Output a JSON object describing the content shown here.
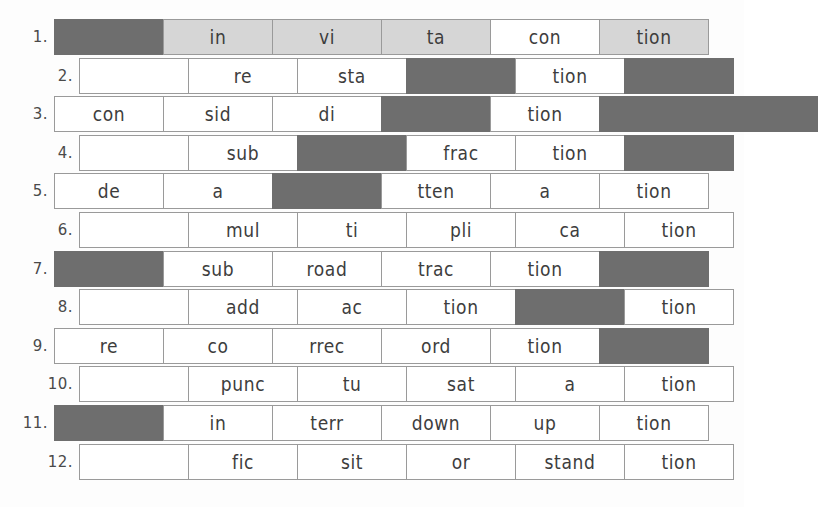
{
  "worksheet": {
    "title": "Syllable Grid Worksheet",
    "cell_width": 110,
    "row_height": 36,
    "colors": {
      "blocked": "#6e6e6e",
      "highlight": "#d6d6d6",
      "open": "#ffffff",
      "border": "#9a9a9a",
      "text": "#3d3d3d"
    },
    "rows": [
      {
        "number": "1.",
        "offset": 0,
        "highlight": true,
        "cells": [
          {
            "text": "",
            "state": "blocked"
          },
          {
            "text": "in",
            "state": "highlight"
          },
          {
            "text": "vi",
            "state": "highlight"
          },
          {
            "text": "ta",
            "state": "highlight"
          },
          {
            "text": "con",
            "state": "open"
          },
          {
            "text": "tion",
            "state": "highlight"
          }
        ]
      },
      {
        "number": "2.",
        "offset": 1,
        "highlight": false,
        "cells": [
          {
            "text": "",
            "state": "open"
          },
          {
            "text": "re",
            "state": "open"
          },
          {
            "text": "sta",
            "state": "open"
          },
          {
            "text": "",
            "state": "blocked"
          },
          {
            "text": "tion",
            "state": "open"
          },
          {
            "text": "",
            "state": "blocked"
          }
        ]
      },
      {
        "number": "3.",
        "offset": 0,
        "highlight": false,
        "cells": [
          {
            "text": "con",
            "state": "open"
          },
          {
            "text": "sid",
            "state": "open"
          },
          {
            "text": "di",
            "state": "open"
          },
          {
            "text": "",
            "state": "blocked"
          },
          {
            "text": "tion",
            "state": "open"
          },
          {
            "text": "",
            "state": "blocked"
          },
          {
            "text": "",
            "state": "blocked"
          }
        ]
      },
      {
        "number": "4.",
        "offset": 1,
        "highlight": false,
        "cells": [
          {
            "text": "",
            "state": "open"
          },
          {
            "text": "sub",
            "state": "open"
          },
          {
            "text": "",
            "state": "blocked"
          },
          {
            "text": "frac",
            "state": "open"
          },
          {
            "text": "tion",
            "state": "open"
          },
          {
            "text": "",
            "state": "blocked"
          }
        ]
      },
      {
        "number": "5.",
        "offset": 0,
        "highlight": false,
        "cells": [
          {
            "text": "de",
            "state": "open"
          },
          {
            "text": "a",
            "state": "open"
          },
          {
            "text": "",
            "state": "blocked"
          },
          {
            "text": "tten",
            "state": "open"
          },
          {
            "text": "a",
            "state": "open"
          },
          {
            "text": "tion",
            "state": "open"
          }
        ]
      },
      {
        "number": "6.",
        "offset": 1,
        "highlight": false,
        "cells": [
          {
            "text": "",
            "state": "open"
          },
          {
            "text": "mul",
            "state": "open"
          },
          {
            "text": "ti",
            "state": "open"
          },
          {
            "text": "pli",
            "state": "open"
          },
          {
            "text": "ca",
            "state": "open"
          },
          {
            "text": "tion",
            "state": "open"
          }
        ]
      },
      {
        "number": "7.",
        "offset": 0,
        "highlight": false,
        "cells": [
          {
            "text": "",
            "state": "blocked"
          },
          {
            "text": "sub",
            "state": "open"
          },
          {
            "text": "road",
            "state": "open"
          },
          {
            "text": "trac",
            "state": "open"
          },
          {
            "text": "tion",
            "state": "open"
          },
          {
            "text": "",
            "state": "blocked"
          }
        ]
      },
      {
        "number": "8.",
        "offset": 1,
        "highlight": false,
        "cells": [
          {
            "text": "",
            "state": "open"
          },
          {
            "text": "add",
            "state": "open"
          },
          {
            "text": "ac",
            "state": "open"
          },
          {
            "text": "tion",
            "state": "open"
          },
          {
            "text": "",
            "state": "blocked"
          },
          {
            "text": "tion",
            "state": "open"
          }
        ]
      },
      {
        "number": "9.",
        "offset": 0,
        "highlight": false,
        "cells": [
          {
            "text": "re",
            "state": "open"
          },
          {
            "text": "co",
            "state": "open"
          },
          {
            "text": "rrec",
            "state": "open"
          },
          {
            "text": "ord",
            "state": "open"
          },
          {
            "text": "tion",
            "state": "open"
          },
          {
            "text": "",
            "state": "blocked"
          }
        ]
      },
      {
        "number": "10.",
        "offset": 1,
        "highlight": false,
        "cells": [
          {
            "text": "",
            "state": "open"
          },
          {
            "text": "punc",
            "state": "open"
          },
          {
            "text": "tu",
            "state": "open"
          },
          {
            "text": "sat",
            "state": "open"
          },
          {
            "text": "a",
            "state": "open"
          },
          {
            "text": "tion",
            "state": "open"
          }
        ]
      },
      {
        "number": "11.",
        "offset": 0,
        "highlight": false,
        "cells": [
          {
            "text": "",
            "state": "blocked"
          },
          {
            "text": "in",
            "state": "open"
          },
          {
            "text": "terr",
            "state": "open"
          },
          {
            "text": "down",
            "state": "open"
          },
          {
            "text": "up",
            "state": "open"
          },
          {
            "text": "tion",
            "state": "open"
          }
        ]
      },
      {
        "number": "12.",
        "offset": 1,
        "highlight": false,
        "cells": [
          {
            "text": "",
            "state": "open"
          },
          {
            "text": "fic",
            "state": "open"
          },
          {
            "text": "sit",
            "state": "open"
          },
          {
            "text": "or",
            "state": "open"
          },
          {
            "text": "stand",
            "state": "open"
          },
          {
            "text": "tion",
            "state": "open"
          }
        ]
      }
    ]
  }
}
